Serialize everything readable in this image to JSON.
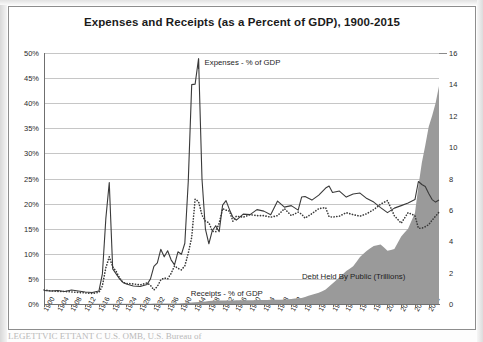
{
  "figure": {
    "title": "Expenses and Receipts (as a Percent of GDP), 1900-2015",
    "footer_partial": "LEGETTVIC ETTANT C        U.S. OMB, U.S. Bureau of",
    "colors": {
      "line": "#3a3a3a",
      "area_fill": "#9a9a9a",
      "grid": "#c6c6c6",
      "axis": "#6f6f6f",
      "background": "#ffffff"
    }
  },
  "annotations": {
    "expenses": "Expenses - % of GDP",
    "receipts": "Receipts - % of GDP",
    "debt_line1": "Debt Held By Public",
    "debt_line2": "(Trillions)"
  },
  "chart_data": {
    "type": "line",
    "title": "Expenses and Receipts (as a Percent of GDP), 1900-2015",
    "xlabel": "",
    "ylabel": "",
    "y2label": "",
    "grid": true,
    "legend_position": "inline-annotations",
    "xlim": [
      1900,
      2015
    ],
    "ylim": [
      0,
      50
    ],
    "y2lim": [
      0,
      16
    ],
    "yticks": [
      "0%",
      "5%",
      "10%",
      "15%",
      "20%",
      "25%",
      "30%",
      "35%",
      "40%",
      "45%",
      "50%"
    ],
    "y2ticks": [
      "0",
      "2",
      "4",
      "6",
      "8",
      "10",
      "12",
      "14",
      "16"
    ],
    "xticks": [
      1900,
      1904,
      1908,
      1912,
      1916,
      1920,
      1924,
      1928,
      1932,
      1936,
      1940,
      1944,
      1948,
      1952,
      1956,
      1960,
      1964,
      1968,
      1972,
      1976,
      1980,
      1984,
      1988,
      1992,
      1996,
      2000,
      2004,
      2008,
      2012
    ],
    "series": [
      {
        "name": "Expenses - % of GDP",
        "style": "solid",
        "axis": "left",
        "x": [
          1900,
          1902,
          1904,
          1906,
          1908,
          1910,
          1912,
          1914,
          1916,
          1917,
          1918,
          1919,
          1920,
          1921,
          1922,
          1923,
          1924,
          1926,
          1928,
          1930,
          1931,
          1932,
          1933,
          1934,
          1935,
          1936,
          1937,
          1938,
          1939,
          1940,
          1941,
          1942,
          1943,
          1944,
          1945,
          1946,
          1947,
          1948,
          1949,
          1950,
          1951,
          1952,
          1953,
          1954,
          1955,
          1956,
          1958,
          1960,
          1962,
          1964,
          1966,
          1968,
          1970,
          1972,
          1974,
          1975,
          1976,
          1978,
          1980,
          1982,
          1983,
          1984,
          1986,
          1988,
          1990,
          1992,
          1994,
          1996,
          1998,
          2000,
          2002,
          2004,
          2006,
          2008,
          2009,
          2010,
          2011,
          2012,
          2013,
          2014,
          2015
        ],
        "y": [
          2.7,
          2.6,
          2.7,
          2.5,
          2.8,
          2.6,
          2.4,
          2.3,
          2.6,
          6.0,
          17.0,
          24.2,
          7.0,
          6.0,
          5.0,
          4.3,
          4.0,
          3.6,
          3.5,
          3.9,
          5.0,
          7.5,
          8.2,
          10.9,
          9.4,
          10.6,
          8.8,
          7.8,
          10.4,
          9.9,
          12.1,
          24.4,
          43.7,
          43.8,
          48.9,
          24.9,
          14.9,
          12.0,
          14.6,
          15.6,
          14.4,
          19.7,
          20.6,
          18.8,
          17.3,
          16.7,
          17.9,
          17.8,
          18.8,
          18.5,
          17.8,
          20.5,
          19.3,
          19.6,
          18.7,
          21.3,
          21.4,
          20.7,
          21.7,
          23.1,
          23.5,
          22.2,
          22.5,
          21.3,
          21.9,
          22.1,
          21.0,
          20.3,
          19.2,
          18.2,
          19.1,
          19.6,
          20.1,
          20.8,
          24.4,
          23.8,
          23.4,
          22.0,
          20.8,
          20.3,
          20.7
        ]
      },
      {
        "name": "Receipts - % of GDP",
        "style": "dotted",
        "axis": "left",
        "x": [
          1900,
          1902,
          1904,
          1906,
          1908,
          1910,
          1912,
          1914,
          1916,
          1917,
          1918,
          1919,
          1920,
          1921,
          1922,
          1923,
          1924,
          1926,
          1928,
          1930,
          1931,
          1932,
          1933,
          1934,
          1935,
          1936,
          1937,
          1938,
          1939,
          1940,
          1941,
          1942,
          1943,
          1944,
          1945,
          1946,
          1947,
          1948,
          1949,
          1950,
          1951,
          1952,
          1953,
          1954,
          1955,
          1956,
          1958,
          1960,
          1962,
          1964,
          1966,
          1968,
          1970,
          1972,
          1974,
          1975,
          1976,
          1978,
          1980,
          1982,
          1983,
          1984,
          1986,
          1988,
          1990,
          1992,
          1994,
          1996,
          1998,
          2000,
          2002,
          2004,
          2006,
          2008,
          2009,
          2010,
          2011,
          2012,
          2013,
          2014,
          2015
        ],
        "y": [
          2.8,
          2.6,
          2.5,
          2.5,
          2.4,
          2.3,
          2.2,
          2.1,
          2.3,
          3.6,
          7.2,
          9.4,
          7.4,
          6.5,
          5.2,
          4.3,
          4.1,
          4.0,
          3.8,
          4.2,
          3.7,
          2.8,
          3.5,
          4.8,
          5.2,
          5.0,
          6.1,
          7.6,
          7.1,
          6.8,
          7.6,
          10.1,
          13.3,
          20.9,
          20.4,
          17.7,
          16.5,
          16.2,
          14.5,
          14.4,
          16.1,
          19.0,
          18.7,
          18.5,
          16.5,
          17.5,
          17.3,
          17.8,
          17.6,
          17.6,
          17.3,
          17.6,
          19.0,
          17.6,
          18.3,
          17.9,
          17.1,
          18.0,
          19.0,
          19.2,
          17.4,
          17.3,
          17.5,
          18.2,
          17.8,
          17.5,
          18.0,
          18.8,
          19.9,
          20.6,
          17.6,
          16.1,
          18.2,
          17.6,
          15.1,
          15.1,
          15.4,
          15.8,
          16.7,
          17.5,
          18.3
        ]
      },
      {
        "name": "Debt Held By Public (Trillions)",
        "style": "area",
        "axis": "right",
        "x": [
          1900,
          1910,
          1920,
          1930,
          1940,
          1950,
          1960,
          1970,
          1975,
          1980,
          1982,
          1984,
          1986,
          1988,
          1990,
          1992,
          1994,
          1996,
          1998,
          2000,
          2002,
          2004,
          2006,
          2008,
          2009,
          2010,
          2011,
          2012,
          2013,
          2014,
          2015
        ],
        "y": [
          0.0,
          0.0,
          0.02,
          0.02,
          0.04,
          0.22,
          0.24,
          0.28,
          0.39,
          0.71,
          0.93,
          1.3,
          1.7,
          2.1,
          2.4,
          3.0,
          3.4,
          3.7,
          3.8,
          3.4,
          3.5,
          4.3,
          4.8,
          5.8,
          7.5,
          9.0,
          10.1,
          11.3,
          12.0,
          12.8,
          13.9
        ]
      }
    ]
  }
}
